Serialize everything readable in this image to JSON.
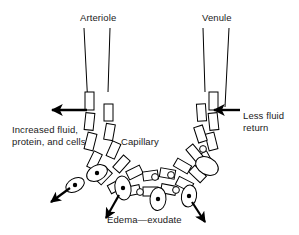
{
  "figure": {
    "background_color": "#ffffff",
    "stroke_color": "#000000",
    "text_color": "#1a1a1a"
  },
  "labels": {
    "arteriole": "Arteriole",
    "venule": "Venule",
    "capillary": "Capillary",
    "increased_fluid": "Increased fluid,\nprotein, and cells",
    "less_fluid_return": "Less fluid\nreturn",
    "edema_exudate": "Edema—exudate"
  },
  "structures": {
    "arteriole_vessel": "arteriole",
    "venule_vessel": "venule",
    "capillary_wall_outer": "outer-endothelial-segments",
    "capillary_wall_inner": "inner-endothelial-segments",
    "escaping_cells": 7,
    "fluid_droplets": 6,
    "outflow_arrows": 4,
    "inflow_arrow": 1
  }
}
